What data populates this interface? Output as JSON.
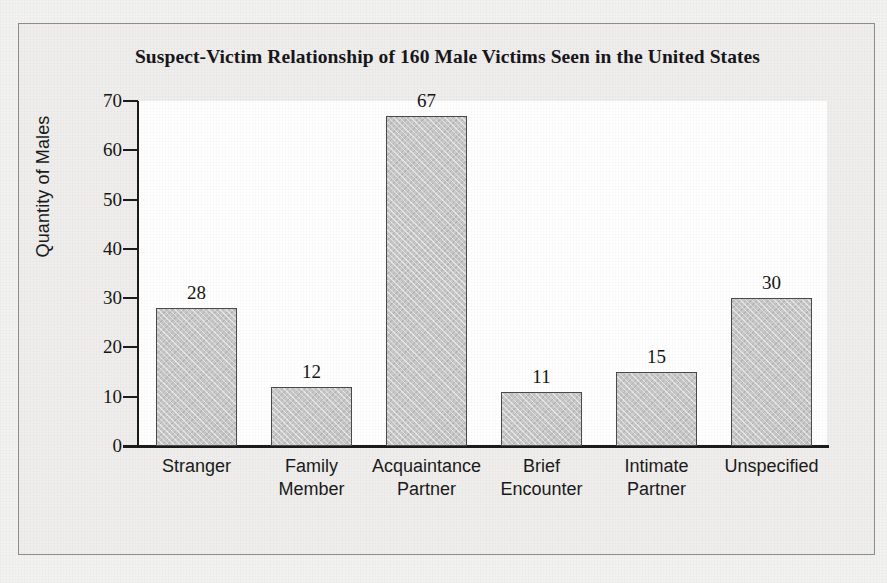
{
  "chart_data": {
    "type": "bar",
    "title": "Suspect-Victim Relationship of 160 Male Victims Seen in the United States",
    "xlabel": "",
    "ylabel": "Quantity of Males",
    "ylim": [
      0,
      70
    ],
    "ytick_step": 10,
    "yticks": [
      "70",
      "60",
      "50",
      "40",
      "30",
      "20",
      "10",
      "0"
    ],
    "grid": false,
    "legend": "none",
    "categories": [
      "Stranger",
      "Family\nMember",
      "Acquaintance\nPartner",
      "Brief\nEncounter",
      "Intimate\nPartner",
      "Unspecified"
    ],
    "category_lines": [
      [
        "Stranger",
        ""
      ],
      [
        "Family",
        "Member"
      ],
      [
        "Acquaintance",
        "Partner"
      ],
      [
        "Brief",
        "Encounter"
      ],
      [
        "Intimate",
        "Partner"
      ],
      [
        "Unspecified",
        ""
      ]
    ],
    "values": [
      28,
      12,
      67,
      11,
      15,
      30
    ],
    "value_labels": [
      "28",
      "12",
      "67",
      "11",
      "15",
      "30"
    ],
    "bar_color": "#c9c9c9",
    "bar_edge_color": "#4a4a4a",
    "plot_background": "#ffffff",
    "figure_background": "#efeeec",
    "text_color": "#161616"
  }
}
